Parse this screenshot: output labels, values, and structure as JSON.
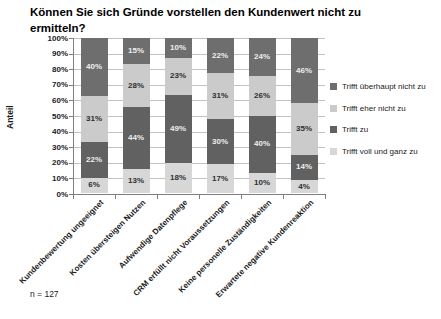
{
  "page_background": "#ffffff",
  "chart_data": {
    "type": "bar",
    "variant": "stacked-column-100",
    "title": "Können Sie sich Gründe vorstellen den Kundenwert nicht zu ermitteln?",
    "title_lines": [
      "Können Sie sich Gründe vorstellen den Kundenwert nicht zu",
      "ermitteln?"
    ],
    "xlabel": "",
    "ylabel": "Anteil",
    "note": "n = 127",
    "ylim": [
      0,
      100
    ],
    "grid": true,
    "legend_position": "right",
    "y_ticks": [
      "0%",
      "10%",
      "20%",
      "30%",
      "40%",
      "50%",
      "60%",
      "70%",
      "80%",
      "90%",
      "100%"
    ],
    "categories": [
      "Kundenbewertung ungeeignet",
      "Kosten übersteigen Nutzen",
      "Aufwendige Datenpflege",
      "CRM erfüllt nicht Voraussetzungen",
      "Keine personelle Zuständigkeiten",
      "Erwartete negative Kundenreaktion"
    ],
    "series": [
      {
        "name": "Trifft überhaupt nicht zu",
        "stack_position": "top",
        "color": "#6e6e6e",
        "label_color": "#efefef",
        "values": [
          40,
          15,
          10,
          22,
          24,
          46
        ]
      },
      {
        "name": "Trifft eher nicht zu",
        "stack_position": "upper-mid",
        "color": "#cbcbcb",
        "label_color": "#2f2f2f",
        "values": [
          31,
          28,
          23,
          31,
          26,
          35
        ]
      },
      {
        "name": "Trifft zu",
        "stack_position": "lower-mid",
        "color": "#616161",
        "label_color": "#efefef",
        "values": [
          22,
          44,
          49,
          30,
          40,
          14
        ]
      },
      {
        "name": "Trifft voll und ganz zu",
        "stack_position": "bottom",
        "color": "#d7d7d7",
        "label_color": "#2f2f2f",
        "values": [
          6,
          13,
          18,
          17,
          10,
          4
        ]
      }
    ],
    "colors": {
      "gridline": "#c3c3c3",
      "axis": "#7f7f7f",
      "text": "#1a1a1a"
    }
  }
}
